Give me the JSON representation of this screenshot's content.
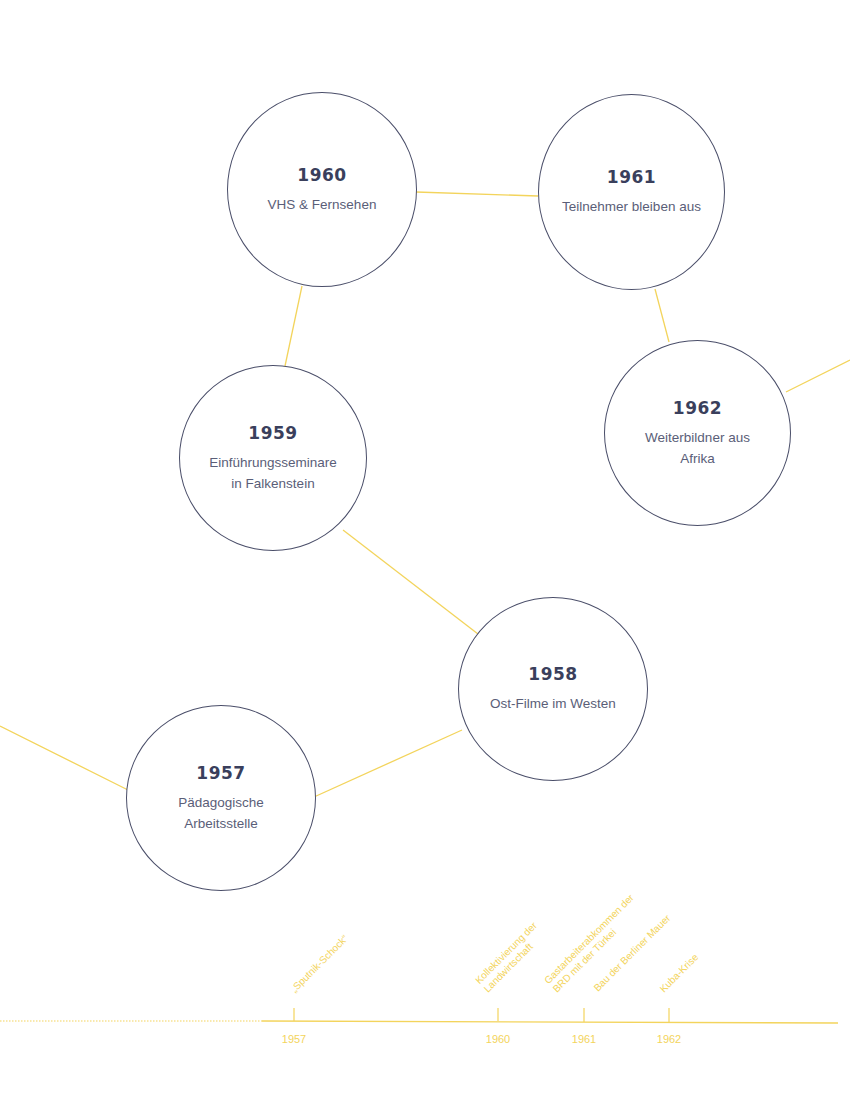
{
  "colors": {
    "connector": "#f3d45c",
    "circle_border": "#4a4e69",
    "year_text": "#3a3f5c",
    "title_text": "#5a5e78",
    "timeline": "#f3d45c"
  },
  "nodes": [
    {
      "year": "1957",
      "title_lines": [
        "Pädagogische",
        "Arbeitsstelle"
      ]
    },
    {
      "year": "1958",
      "title_lines": [
        "Ost-Filme im Westen"
      ]
    },
    {
      "year": "1959",
      "title_lines": [
        "Einführungsseminare",
        "in Falkenstein"
      ]
    },
    {
      "year": "1960",
      "title_lines": [
        "VHS & Fernsehen"
      ]
    },
    {
      "year": "1961",
      "title_lines": [
        "Teilnehmer bleiben aus"
      ]
    },
    {
      "year": "1962",
      "title_lines": [
        "Weiterbildner aus",
        "Afrika"
      ]
    }
  ],
  "timeline": {
    "ticks": [
      {
        "label": "1957"
      },
      {
        "label": "1960"
      },
      {
        "label": "1961"
      },
      {
        "label": "1962"
      }
    ],
    "events": [
      {
        "lines": [
          "„Sputnik-Schock“"
        ]
      },
      {
        "lines": [
          "Kollektivierung der",
          "Landwirtschaft"
        ]
      },
      {
        "lines": [
          "Gastarbeiterabkommen der",
          "BRD mit der Türkei"
        ]
      },
      {
        "lines": [
          "Bau der Berliner Mauer"
        ]
      },
      {
        "lines": [
          "Kuba-Krise"
        ]
      }
    ]
  }
}
